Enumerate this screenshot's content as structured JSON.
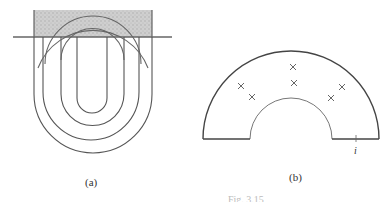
{
  "figure": {
    "panel_a": {
      "label": "(a)",
      "shaded_region": {
        "x": 34,
        "y": 10,
        "width": 118,
        "height": 27,
        "fill": "#c8c8c8"
      },
      "boundary_line": {
        "x1": 13,
        "x2": 172,
        "y": 37
      },
      "loops": [
        {
          "left_x": 77,
          "right_x": 107,
          "radius": 15
        },
        {
          "left_x": 61,
          "right_x": 124,
          "radius": 31
        },
        {
          "left_x": 43,
          "right_x": 139,
          "radius": 48
        },
        {
          "left_x": 34,
          "right_x": 152,
          "radius": 59
        }
      ]
    },
    "panel_b": {
      "label": "(b)",
      "outer_radius": 88,
      "inner_radius": 41,
      "center": {
        "x": 291,
        "y": 139
      },
      "crosses": [
        {
          "x": 241,
          "y": 86
        },
        {
          "x": 252,
          "y": 97
        },
        {
          "x": 293,
          "y": 67
        },
        {
          "x": 294,
          "y": 83
        },
        {
          "x": 342,
          "y": 87
        },
        {
          "x": 331,
          "y": 98
        }
      ],
      "tick_label": "i"
    },
    "caption": "Fig. 3.15"
  }
}
